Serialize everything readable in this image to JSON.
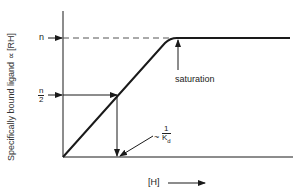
{
  "diagram": {
    "type": "binding-saturation-curve",
    "y_axis_label": "Specifically bound ligand ∝ [RH]",
    "x_axis_label": "[H]",
    "y_ticks": [
      {
        "label": "n",
        "role": "maximum binding"
      },
      {
        "label_num": "n",
        "label_den": "2",
        "role": "half-maximal binding"
      }
    ],
    "annotations": {
      "saturation": "saturation",
      "kd_prefix": "~",
      "kd_num": "1",
      "kd_den": "K",
      "kd_sub": "d"
    },
    "colors": {
      "line": "#1a1a1a",
      "background": "#ffffff"
    }
  }
}
